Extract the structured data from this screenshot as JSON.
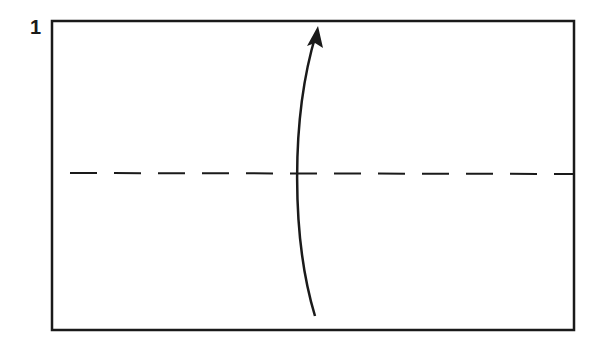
{
  "diagram": {
    "step_number": "1",
    "paper": {
      "x": 52,
      "y": 21,
      "width": 522,
      "height": 309,
      "stroke": "#1a1a1a"
    },
    "fold_line": {
      "type": "valley-fold",
      "style": "dashed",
      "y": 173,
      "x1": 70,
      "x2": 573
    },
    "arrow": {
      "direction": "up",
      "meaning": "fold bottom half up",
      "start": [
        315,
        316
      ],
      "end": [
        318,
        27
      ]
    },
    "colors": {
      "ink": "#1a1a1a",
      "background": "#ffffff"
    }
  }
}
